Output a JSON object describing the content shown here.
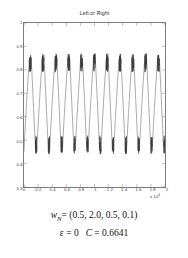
{
  "chart_data": {
    "type": "line",
    "title": "Left or Right",
    "xlabel": "",
    "ylabel": "",
    "xlim": [
      0,
      20000
    ],
    "ylim": [
      0.3,
      1.0
    ],
    "grid": false,
    "legend": null,
    "x_exponent_label": "x 10",
    "x_exponent_power": "4",
    "xticks": [
      "0",
      "0.2",
      "0.4",
      "0.6",
      "0.8",
      "1",
      "1.2",
      "1.4",
      "1.6",
      "1.8",
      "2"
    ],
    "xtick_values": [
      0,
      2000,
      4000,
      6000,
      8000,
      10000,
      12000,
      14000,
      16000,
      18000,
      20000
    ],
    "yticks": [
      "0.3",
      "0.4",
      "0.5",
      "0.6",
      "0.7",
      "0.8",
      "0.9",
      "1"
    ],
    "ytick_values": [
      0.3,
      0.4,
      0.5,
      0.6,
      0.7,
      0.8,
      0.9,
      1.0
    ],
    "series": [
      {
        "name": "Left or Right",
        "color": "#3a3a3a",
        "description": "Quasi-periodic oscillation, 11 cycles across 0-20000, peaks near 0.85 with noisy bursts, troughs near 0.45 with noisy bursts",
        "cycles": 11,
        "peak_value": 0.85,
        "trough_value": 0.45,
        "peak_noise_band": [
          0.79,
          0.87
        ],
        "trough_noise_band": [
          0.44,
          0.52
        ]
      }
    ]
  },
  "caption": {
    "line1_prefix": "w",
    "line1_subscript": "N",
    "line1_equals": "= (0.5, 2.0, 0.5, 0.1)",
    "line2_epsilon": "ε = 0",
    "line2_c": "C",
    "line2_c_value": "= 0.6641"
  },
  "colors": {
    "axis": "#7d7d7d",
    "line": "#3a3a3a",
    "text": "#3a3a3a",
    "background": "#ffffff"
  }
}
